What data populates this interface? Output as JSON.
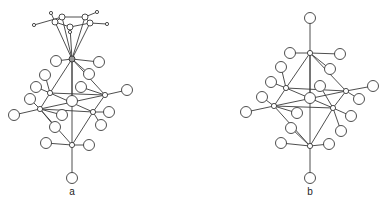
{
  "figure": {
    "panels": [
      {
        "id": "a",
        "label": "a",
        "label_pos": [
          72,
          194
        ]
      },
      {
        "id": "b",
        "label": "b",
        "label_pos": [
          310,
          194
        ]
      }
    ],
    "colors": {
      "line": "#3a3a3a",
      "background": "#ffffff",
      "metal_fill": "#9a9a9a"
    }
  },
  "structure_a": {
    "metal_top": [
      72,
      59
    ],
    "cp_ring": [
      [
        55,
        22
      ],
      [
        62,
        17
      ],
      [
        85,
        17
      ],
      [
        90,
        23
      ],
      [
        70,
        27
      ]
    ],
    "cp_h": [
      [
        51,
        13
      ],
      [
        34,
        25
      ],
      [
        97,
        12
      ],
      [
        107,
        24
      ],
      [
        70,
        32
      ]
    ],
    "nb": [
      [
        50,
        93
      ],
      [
        105,
        95
      ],
      [
        40,
        109
      ],
      [
        93,
        112
      ],
      [
        72,
        145
      ]
    ],
    "center": [
      72,
      101
    ],
    "cl": [
      [
        56,
        61
      ],
      [
        99,
        62
      ],
      [
        45,
        75
      ],
      [
        89,
        74
      ],
      [
        36,
        87
      ],
      [
        81,
        87
      ],
      [
        30,
        99
      ],
      [
        127,
        90
      ],
      [
        14,
        115
      ],
      [
        62,
        115
      ],
      [
        109,
        112
      ],
      [
        55,
        127
      ],
      [
        101,
        125
      ],
      [
        46,
        143
      ],
      [
        89,
        145
      ],
      [
        72,
        178
      ]
    ]
  },
  "structure_b": {
    "nb": [
      [
        310,
        53
      ],
      [
        286,
        88
      ],
      [
        346,
        91
      ],
      [
        274,
        106
      ],
      [
        333,
        108
      ],
      [
        310,
        146
      ]
    ],
    "center": [
      310,
      98
    ],
    "cl": [
      [
        310,
        18
      ],
      [
        290,
        53
      ],
      [
        340,
        54
      ],
      [
        281,
        67
      ],
      [
        330,
        69
      ],
      [
        271,
        82
      ],
      [
        320,
        86
      ],
      [
        373,
        86
      ],
      [
        262,
        97
      ],
      [
        359,
        99
      ],
      [
        246,
        112
      ],
      [
        297,
        113
      ],
      [
        351,
        116
      ],
      [
        291,
        128
      ],
      [
        341,
        131
      ],
      [
        281,
        143
      ],
      [
        329,
        144
      ],
      [
        310,
        178
      ]
    ]
  }
}
